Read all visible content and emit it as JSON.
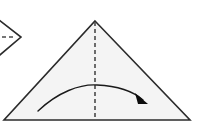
{
  "figure": {
    "width": 197,
    "height": 133,
    "background_color": "#ffffff"
  },
  "shapes": {
    "main_triangle": {
      "name": "paper-triangle",
      "apex": {
        "x": 95,
        "y": 21
      },
      "bottom_left": {
        "x": 4,
        "y": 120
      },
      "bottom_right": {
        "x": 190,
        "y": 120
      },
      "fill_color": "#f4f4f4",
      "stroke_color": "#2b2b2b",
      "stroke_width": 1.6
    },
    "fold_line": {
      "name": "vertical-fold-line",
      "x": 95,
      "y_start": 22,
      "y_end": 120,
      "stroke_color": "#4a4a4a",
      "stroke_width": 1.6,
      "dash_pattern": "4,3",
      "style": "dashed"
    },
    "fold_arrow": {
      "name": "fold-direction-arrow",
      "path": "M 38,111 C 58,92 80,84 97,85 C 118,86 134,92 143,100",
      "start": {
        "x": 38,
        "y": 111
      },
      "arc_peak": {
        "x": 95,
        "y": 85
      },
      "end": {
        "x": 143,
        "y": 100
      },
      "stroke_color": "#1a1a1a",
      "stroke_width": 1.4,
      "direction": "left-to-right"
    },
    "arrow_head": {
      "name": "arrowhead",
      "points": "148,104 135,93 138,104",
      "fill_color": "#0d0d0d"
    },
    "previous_step_chevron": {
      "name": "previous-step-chevron",
      "upper_edge": {
        "x1": -6,
        "y1": 16,
        "x2": 21,
        "y2": 37
      },
      "lower_edge": {
        "x1": 21,
        "y1": 37,
        "x2": -6,
        "y2": 60
      },
      "stroke_color": "#2b2b2b",
      "stroke_width": 1.6
    },
    "previous_step_fold_line": {
      "name": "previous-step-fold-line",
      "x_start": 2,
      "x_end": 16,
      "y": 37,
      "stroke_color": "#4a4a4a",
      "stroke_width": 1.6,
      "dash_pattern": "4,3",
      "style": "dashed"
    }
  }
}
